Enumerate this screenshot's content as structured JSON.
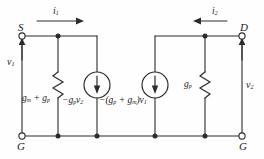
{
  "diagram": {
    "type": "electrical-schematic",
    "stroke_color": "#2b2b2b",
    "background_color": "#fefefe",
    "terminals": [
      {
        "id": "S",
        "label": "S",
        "x": 22,
        "y": 32,
        "position": "top-left"
      },
      {
        "id": "D",
        "label": "D",
        "x": 242,
        "y": 32,
        "position": "top-right"
      },
      {
        "id": "G_left",
        "label": "G",
        "x": 22,
        "y": 136,
        "position": "bottom-left"
      },
      {
        "id": "G_right",
        "label": "G",
        "x": 242,
        "y": 136,
        "position": "bottom-right"
      }
    ],
    "currents": [
      {
        "label": "i",
        "sub": "1",
        "direction": "right",
        "x": 55,
        "y": 16
      },
      {
        "label": "i",
        "sub": "2",
        "direction": "left",
        "x": 215,
        "y": 16
      }
    ],
    "voltages": [
      {
        "label": "v",
        "sub": "1",
        "x": 8,
        "y": 62,
        "polarity_arrow": "up"
      },
      {
        "label": "v",
        "sub": "2",
        "x": 246,
        "y": 84,
        "polarity_arrow": "up"
      }
    ],
    "elements": [
      {
        "type": "resistor",
        "name": "left-conductance",
        "label_main": "g",
        "label_sub": "m",
        "label_tail": " + g",
        "label_tail_sub": "p",
        "x": 24,
        "y": 96
      },
      {
        "type": "resistor",
        "name": "right-conductance",
        "label_main": "g",
        "label_sub": "p",
        "x": 186,
        "y": 82
      }
    ],
    "sources": [
      {
        "type": "current-source",
        "name": "source-left",
        "arrow": "down",
        "cx": 97,
        "cy": 85,
        "expr_prefix": "−g",
        "expr_sub1": "p",
        "expr_var": "v",
        "expr_sub2": "2",
        "label_x": 64,
        "label_y": 100
      },
      {
        "type": "current-source",
        "name": "source-right",
        "arrow": "down",
        "cx": 155,
        "cy": 85,
        "expr_prefix": "−(g",
        "expr_sub1": "p",
        "expr_mid": " + g",
        "expr_sub2": "m",
        "expr_suffix": ")v",
        "expr_sub3": "1",
        "label_x": 101,
        "label_y": 100
      }
    ]
  }
}
